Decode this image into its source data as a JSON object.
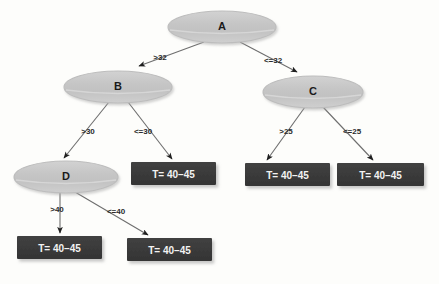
{
  "diagram": {
    "type": "decision-tree",
    "title": "",
    "background_color": "#fdfdfb",
    "decision_node_fill": "#c9c9c9",
    "decision_node_stroke": "#b0b0b0",
    "leaf_node_fill": "#3a3a3a",
    "leaf_node_text_color": "#f2f2f2",
    "edge_color": "#6e6e6e",
    "nodes": [
      {
        "id": "A",
        "label": "A",
        "shape": "ellipse",
        "cx": 222,
        "cy": 27,
        "rx": 54,
        "ry": 16
      },
      {
        "id": "B",
        "label": "B",
        "shape": "ellipse",
        "cx": 118,
        "cy": 87,
        "rx": 54,
        "ry": 16
      },
      {
        "id": "C",
        "label": "C",
        "shape": "ellipse",
        "cx": 313,
        "cy": 92,
        "rx": 50,
        "ry": 16
      },
      {
        "id": "D",
        "label": "D",
        "shape": "ellipse",
        "cx": 66,
        "cy": 177,
        "rx": 52,
        "ry": 16
      }
    ],
    "leaves": [
      {
        "id": "L1",
        "label": "T= 40–45",
        "shape": "rect",
        "x": 131,
        "y": 162,
        "w": 85,
        "h": 23
      },
      {
        "id": "L2",
        "label": "T= 40–45",
        "shape": "rect",
        "x": 245,
        "y": 163,
        "w": 85,
        "h": 23
      },
      {
        "id": "L3",
        "label": "T= 40–45",
        "shape": "rect",
        "x": 337,
        "y": 163,
        "w": 87,
        "h": 23
      },
      {
        "id": "L4",
        "label": "T= 40–45",
        "shape": "rect",
        "x": 17,
        "y": 236,
        "w": 85,
        "h": 23
      },
      {
        "id": "L5",
        "label": "T= 40–45",
        "shape": "rect",
        "x": 127,
        "y": 238,
        "w": 85,
        "h": 23
      }
    ],
    "edges": [
      {
        "from": "A",
        "to": "B",
        "label": ">32",
        "label_x": 160,
        "label_y": 57,
        "x1": 204,
        "y1": 42,
        "x2": 139,
        "y2": 66
      },
      {
        "from": "A",
        "to": "C",
        "label": "<=32",
        "label_x": 273,
        "label_y": 60,
        "x1": 240,
        "y1": 42,
        "x2": 297,
        "y2": 72
      },
      {
        "from": "B",
        "to": "D",
        "label": ">30",
        "label_x": 88,
        "label_y": 131,
        "x1": 109,
        "y1": 102,
        "x2": 64,
        "y2": 158
      },
      {
        "from": "B",
        "to": "L1",
        "label": "<=30",
        "label_x": 143,
        "label_y": 131,
        "x1": 128,
        "y1": 102,
        "x2": 172,
        "y2": 159
      },
      {
        "from": "C",
        "to": "L2",
        "label": ">25",
        "label_x": 286,
        "label_y": 131,
        "x1": 305,
        "y1": 107,
        "x2": 267,
        "y2": 160
      },
      {
        "from": "C",
        "to": "L3",
        "label": "<=25",
        "label_x": 352,
        "label_y": 131,
        "x1": 323,
        "y1": 107,
        "x2": 373,
        "y2": 160
      },
      {
        "from": "D",
        "to": "L4",
        "label": ">40",
        "label_x": 57,
        "label_y": 209,
        "x1": 60,
        "y1": 192,
        "x2": 60,
        "y2": 233
      },
      {
        "from": "D",
        "to": "L5",
        "label": "<=40",
        "label_x": 116,
        "label_y": 211,
        "x1": 75,
        "y1": 192,
        "x2": 148,
        "y2": 235
      }
    ]
  }
}
